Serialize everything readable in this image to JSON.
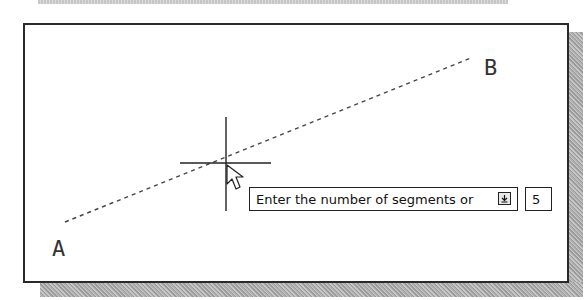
{
  "canvas": {
    "point_a_label": "A",
    "point_b_label": "B",
    "line": {
      "x1": 65,
      "y1": 222,
      "x2": 471,
      "y2": 58,
      "style": "dashed"
    },
    "crosshair": {
      "cx": 226,
      "cy": 163,
      "half_h": 46,
      "half_v": 47
    }
  },
  "dynamic_input": {
    "prompt": "Enter the number of segments or",
    "options_icon": "down-arrow-options-icon",
    "value": "5"
  },
  "colors": {
    "border": "#2a2a2a",
    "shadow": "#b0b0b0",
    "line": "#444444"
  }
}
